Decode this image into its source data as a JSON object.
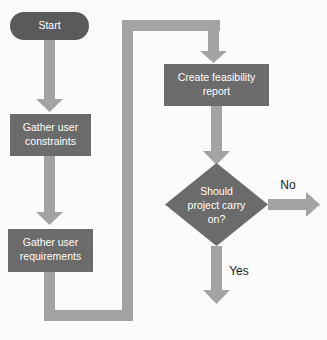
{
  "diagram": {
    "type": "flowchart",
    "background_color": "#fbfbfb",
    "palette": {
      "terminator_fill": "#5a5a5a",
      "process_fill": "#6b6b6b",
      "decision_fill": "#6b6b6b",
      "arrow_fill": "#a3a3a3",
      "node_text_color": "#ffffff",
      "edge_label_color": "#1a1a1a"
    },
    "nodes": [
      {
        "id": "start",
        "shape": "stadium",
        "label": "Start",
        "label_lines": [
          "Start"
        ]
      },
      {
        "id": "gather-constraints",
        "shape": "rectangle",
        "label": "Gather user constraints",
        "label_lines": [
          "Gather user",
          "constraints"
        ]
      },
      {
        "id": "gather-requirements",
        "shape": "rectangle",
        "label": "Gather user requirements",
        "label_lines": [
          "Gather user",
          "requirements"
        ]
      },
      {
        "id": "create-report",
        "shape": "rectangle",
        "label": "Create feasibility report",
        "label_lines": [
          "Create feasibility",
          "report"
        ]
      },
      {
        "id": "decision",
        "shape": "diamond",
        "label": "Should project carry on?",
        "label_lines": [
          "Should",
          "project carry",
          "on?"
        ]
      }
    ],
    "edges": [
      {
        "id": "start-to-constraints",
        "from": "start",
        "to": "gather-constraints",
        "label": ""
      },
      {
        "id": "constraints-to-requirements",
        "from": "gather-constraints",
        "to": "gather-requirements",
        "label": ""
      },
      {
        "id": "requirements-loop-to-report",
        "from": "gather-requirements",
        "to": "create-report",
        "label": ""
      },
      {
        "id": "report-to-decision",
        "from": "create-report",
        "to": "decision",
        "label": ""
      },
      {
        "id": "decision-no",
        "from": "decision",
        "to": "",
        "label": "No"
      },
      {
        "id": "decision-yes",
        "from": "decision",
        "to": "",
        "label": "Yes"
      }
    ],
    "edge_labels": {
      "no": "No",
      "yes": "Yes"
    }
  }
}
